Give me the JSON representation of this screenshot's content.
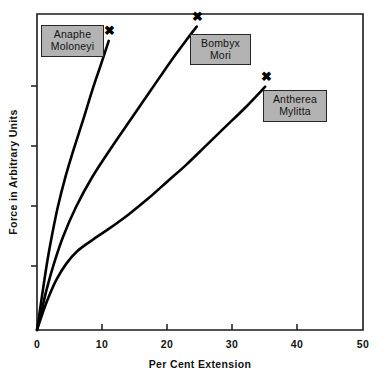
{
  "chart_data": {
    "type": "line",
    "title": "",
    "xlabel": "Per Cent Extension",
    "ylabel": "Force in Arbitrary Units",
    "xlim": [
      0,
      50
    ],
    "ylim": [
      0,
      100
    ],
    "xticks": [
      0,
      10,
      20,
      30,
      40,
      50
    ],
    "xticklabels": [
      "0",
      "10",
      "20",
      "30",
      "40",
      "50"
    ],
    "yticks": [
      0,
      20,
      40,
      60,
      80
    ],
    "yticklabels": [
      "0",
      "",
      "",
      "",
      ""
    ],
    "grid": false,
    "legend": "inline-callout-boxes",
    "endpoint_marker": "✖",
    "series": [
      {
        "name": "Anaphe Moloneyi",
        "label_line1": "Anaphe",
        "label_line2": "Moloneyi",
        "color": "#000000",
        "points": [
          [
            0.0,
            0.0
          ],
          [
            0.5,
            7.0
          ],
          [
            1.0,
            14.0
          ],
          [
            1.6,
            22.0
          ],
          [
            2.3,
            30.0
          ],
          [
            3.2,
            39.0
          ],
          [
            4.3,
            48.0
          ],
          [
            5.6,
            57.0
          ],
          [
            7.0,
            66.0
          ],
          [
            8.5,
            76.0
          ],
          [
            9.8,
            84.0
          ],
          [
            11.0,
            91.5
          ]
        ],
        "break_point": [
          11.0,
          91.5
        ]
      },
      {
        "name": "Bombyx Mori",
        "label_line1": "Bombyx",
        "label_line2": "Mori",
        "color": "#000000",
        "points": [
          [
            0.0,
            0.0
          ],
          [
            0.7,
            6.0
          ],
          [
            1.5,
            13.0
          ],
          [
            2.6,
            21.0
          ],
          [
            4.0,
            29.5
          ],
          [
            6.0,
            39.0
          ],
          [
            8.5,
            48.5
          ],
          [
            11.5,
            58.0
          ],
          [
            14.5,
            67.0
          ],
          [
            17.5,
            76.0
          ],
          [
            20.5,
            85.0
          ],
          [
            23.0,
            92.0
          ],
          [
            24.5,
            96.0
          ]
        ],
        "break_point": [
          24.5,
          96.0
        ]
      },
      {
        "name": "Antherea Mylitta",
        "label_line1": "Antherea",
        "label_line2": "Mylitta",
        "color": "#000000",
        "points": [
          [
            0.0,
            0.0
          ],
          [
            0.8,
            5.0
          ],
          [
            1.8,
            10.5
          ],
          [
            3.0,
            16.0
          ],
          [
            4.5,
            21.0
          ],
          [
            6.2,
            25.0
          ],
          [
            8.5,
            28.5
          ],
          [
            11.0,
            32.0
          ],
          [
            14.0,
            36.5
          ],
          [
            17.0,
            41.5
          ],
          [
            20.0,
            47.0
          ],
          [
            23.0,
            52.5
          ],
          [
            26.0,
            58.5
          ],
          [
            29.0,
            64.5
          ],
          [
            32.0,
            70.5
          ],
          [
            35.0,
            77.0
          ]
        ],
        "break_point": [
          35.0,
          77.0
        ],
        "note": "has pronounced yield knee around 5-8 per cent extension"
      }
    ]
  },
  "axes": {
    "x_title": "Per Cent Extension",
    "y_title": "Force in Arbitrary Units",
    "x_tick_labels": [
      "0",
      "10",
      "20",
      "30",
      "40",
      "50"
    ],
    "y_zero_label": "0"
  },
  "labels": {
    "anaphe": {
      "line1": "Anaphe",
      "line2": "Moloneyi"
    },
    "bombyx": {
      "line1": "Bombyx",
      "line2": "Mori"
    },
    "antherea": {
      "line1": "Antherea",
      "line2": "Mylitta"
    }
  },
  "markers": {
    "glyph": "✖"
  },
  "colors": {
    "curve": "#000000",
    "axis": "#1a1a1a",
    "label_box_fill": "#b3b3b3",
    "label_box_border": "#262626",
    "background": "#ffffff"
  }
}
